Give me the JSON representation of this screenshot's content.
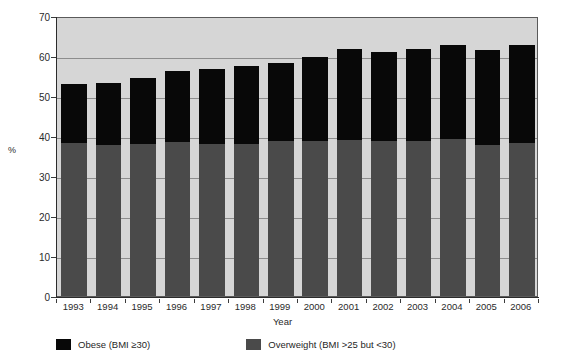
{
  "chart_data": {
    "type": "bar",
    "subtype": "stacked-bar",
    "title": "",
    "xlabel": "Year",
    "ylabel": "%",
    "ylim": [
      0,
      70
    ],
    "yticks": [
      0,
      10,
      20,
      30,
      40,
      50,
      60,
      70
    ],
    "grid": true,
    "grid_orientation": "horizontal",
    "legend_position": "bottom-left",
    "categories": [
      "1993",
      "1994",
      "1995",
      "1996",
      "1997",
      "1998",
      "1999",
      "2000",
      "2001",
      "2002",
      "2003",
      "2004",
      "2005",
      "2006"
    ],
    "series": [
      {
        "name": "Overweight (BMI >25 but <30)",
        "color": "#4a4a4a",
        "values": [
          38.2,
          37.7,
          38.0,
          38.5,
          38.0,
          38.0,
          38.7,
          38.7,
          39.0,
          38.8,
          38.7,
          39.2,
          37.8,
          38.2
        ]
      },
      {
        "name": "Obese (BMI ≥30)",
        "color": "#080808",
        "values": [
          14.8,
          15.6,
          16.5,
          17.8,
          18.7,
          19.4,
          19.6,
          21.1,
          22.7,
          22.1,
          23.0,
          23.6,
          23.8,
          24.5
        ]
      }
    ],
    "totals": [
      53.0,
      53.3,
      54.5,
      56.3,
      56.7,
      57.4,
      58.3,
      59.8,
      61.7,
      60.9,
      61.7,
      62.8,
      61.6,
      62.7
    ],
    "annotations": []
  },
  "axes": {
    "y_label": "%",
    "y_ticks": [
      "70",
      "60",
      "50",
      "40",
      "30",
      "20",
      "10",
      "0"
    ],
    "x_label": "Year",
    "x_ticks": [
      "1993",
      "1994",
      "1995",
      "1996",
      "1997",
      "1998",
      "1999",
      "2000",
      "2001",
      "2002",
      "2003",
      "2004",
      "2005",
      "2006"
    ]
  },
  "legend": {
    "items": [
      {
        "label": "Obese (BMI ≥30)",
        "color": "#080808",
        "swatch": "obese-swatch"
      },
      {
        "label": "Overweight (BMI >25 but <30)",
        "color": "#4a4a4a",
        "swatch": "overweight-swatch"
      }
    ]
  },
  "colors": {
    "obese": "#080808",
    "overweight": "#4a4a4a",
    "plot_background": "#d6d6d6",
    "gridline": "#8d8d8d",
    "axis": "#2b2b2b",
    "page_background": "#ffffff"
  }
}
